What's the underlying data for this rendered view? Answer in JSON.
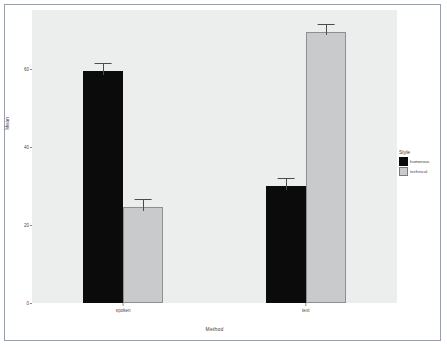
{
  "chart_data": {
    "type": "bar",
    "title": "",
    "xlabel": "Method",
    "ylabel": "Mean",
    "categories": [
      "spoken",
      "text"
    ],
    "series": [
      {
        "name": "humorous",
        "color": "#0b0b0b",
        "values": [
          59.5,
          30.0
        ],
        "errors": [
          2.0,
          2.0
        ]
      },
      {
        "name": "technical",
        "color": "#c9cacb",
        "values": [
          24.5,
          69.5
        ],
        "errors": [
          2.2,
          2.0
        ]
      }
    ],
    "legend_title": "Style",
    "legend_position": "right",
    "ylim": [
      0,
      75
    ],
    "yticks": [
      0,
      20,
      40,
      60
    ],
    "ytick_labels": [
      "0",
      "20",
      "40",
      "60"
    ],
    "grid": false,
    "panel_background": "#eceded",
    "error_bar_color": "#4b4b4b"
  }
}
